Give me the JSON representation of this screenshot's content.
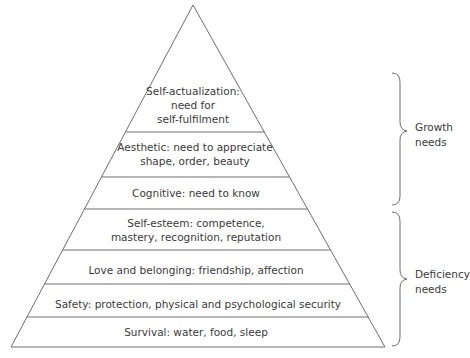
{
  "diagram": {
    "colors": {
      "stroke": "#6e6e6e",
      "text": "#3a3a3a",
      "background": "#ffffff"
    },
    "levels": [
      {
        "id": "self-actualization",
        "lines": [
          "Self-actualization:",
          "need for",
          "self-fulfilment"
        ]
      },
      {
        "id": "aesthetic",
        "lines": [
          "Aesthetic: need to appreciate",
          "shape, order, beauty"
        ]
      },
      {
        "id": "cognitive",
        "lines": [
          "Cognitive: need to know"
        ]
      },
      {
        "id": "self-esteem",
        "lines": [
          "Self-esteem: competence,",
          "mastery, recognition, reputation"
        ]
      },
      {
        "id": "love-belonging",
        "lines": [
          "Love and belonging: friendship, affection"
        ]
      },
      {
        "id": "safety",
        "lines": [
          "Safety: protection, physical and psychological security"
        ]
      },
      {
        "id": "survival",
        "lines": [
          "Survival: water, food, sleep"
        ]
      }
    ],
    "groups": [
      {
        "id": "growth",
        "lines": [
          "Growth",
          "needs"
        ],
        "covers": [
          "self-actualization",
          "aesthetic",
          "cognitive"
        ]
      },
      {
        "id": "deficiency",
        "lines": [
          "Deficiency",
          "needs"
        ],
        "covers": [
          "self-esteem",
          "love-belonging",
          "safety",
          "survival"
        ]
      }
    ]
  }
}
